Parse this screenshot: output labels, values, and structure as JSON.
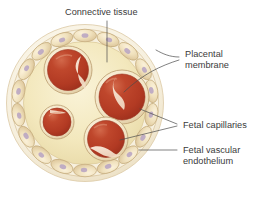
{
  "figure": {
    "canvas": {
      "width": 257,
      "height": 199,
      "background": "#ffffff"
    }
  },
  "labels": {
    "connective_tissue": "Connective tissue",
    "placental_membrane_line1": "Placental",
    "placental_membrane_line2": "membrane",
    "fetal_capillaries": "Fetal capillaries",
    "fetal_vascular_endothelium_line1": "Fetal vascular",
    "fetal_vascular_endothelium_line2": "endothelium"
  },
  "colors": {
    "text": "#3b3b3b",
    "leader_line": "#4a4a4a",
    "outer_membrane_fill": "#f7f2e2",
    "outer_membrane_stroke": "#d9c9a8",
    "trophoblast_cell_fill": "#f0e3c2",
    "trophoblast_cell_stroke": "#c9b184",
    "nucleus_fill": "#b9a6c4",
    "stroma_fill": "#f3e8bf",
    "stroma_edge": "#e3d29a",
    "capillary_blood": "#b33a24",
    "capillary_blood_light": "#d98e6e",
    "endothelium_fill": "#f6e9cd",
    "endothelium_stroke": "#bfa274"
  },
  "structures": {
    "outer_circle": {
      "cx": 85,
      "cy": 103,
      "r": 78
    },
    "inner_stroma_circle": {
      "cx": 85,
      "cy": 103,
      "r": 60
    },
    "trophoblast_cell_count": 18,
    "capillaries": [
      {
        "name": "capillary-upper-left",
        "cx": 68,
        "cy": 70,
        "r": 24
      },
      {
        "name": "capillary-right",
        "cx": 122,
        "cy": 97,
        "r": 27
      },
      {
        "name": "capillary-small-left",
        "cx": 57,
        "cy": 122,
        "r": 17
      },
      {
        "name": "capillary-bottom",
        "cx": 106,
        "cy": 139,
        "r": 22
      }
    ]
  },
  "label_positions": {
    "connective_tissue": {
      "x": 65,
      "y": 15
    },
    "placental_membrane": {
      "x": 185,
      "y": 62
    },
    "fetal_capillaries": {
      "x": 183,
      "y": 127
    },
    "fetal_vascular_endothelium": {
      "x": 183,
      "y": 156
    }
  }
}
